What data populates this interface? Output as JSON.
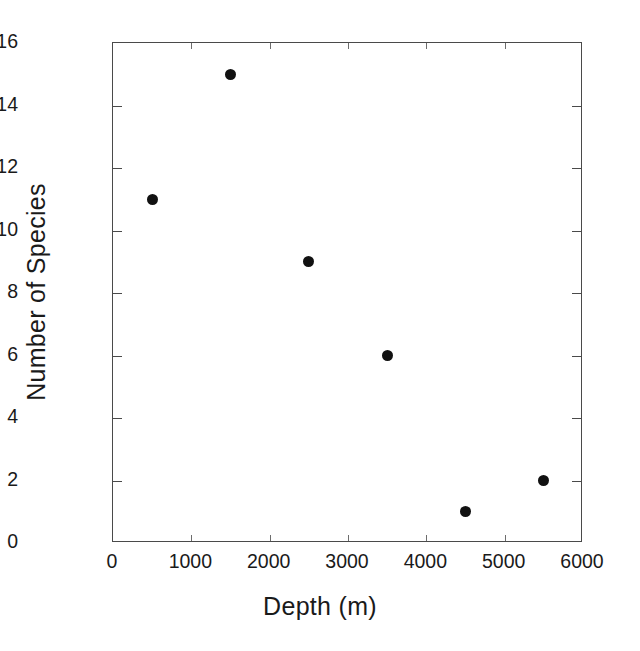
{
  "chart_data": {
    "type": "scatter",
    "title": "",
    "xlabel": "Depth (m)",
    "ylabel": "Number of Species",
    "xlim": [
      0,
      6000
    ],
    "ylim": [
      0,
      16
    ],
    "xticks": [
      0,
      1000,
      2000,
      3000,
      4000,
      5000,
      6000
    ],
    "yticks": [
      0,
      2,
      4,
      6,
      8,
      10,
      12,
      14,
      16
    ],
    "xtick_labels": [
      "0",
      "1000",
      "2000",
      "3000",
      "4000",
      "5000",
      "6000"
    ],
    "ytick_labels": [
      "0",
      "2",
      "4",
      "6",
      "8",
      "10",
      "12",
      "14",
      "16"
    ],
    "grid": false,
    "legend": false,
    "marker": {
      "shape": "circle",
      "filled": true,
      "color": "#111111",
      "size_px": 11
    },
    "axis_color": "#4a4a4a",
    "background": "#ffffff",
    "frame": "full-box",
    "tick_direction": "in",
    "series": [
      {
        "name": "Species count by depth",
        "points": [
          {
            "x": 500,
            "y": 11
          },
          {
            "x": 1500,
            "y": 15
          },
          {
            "x": 2500,
            "y": 9
          },
          {
            "x": 3500,
            "y": 6
          },
          {
            "x": 4500,
            "y": 1
          },
          {
            "x": 5500,
            "y": 2
          }
        ]
      }
    ]
  }
}
